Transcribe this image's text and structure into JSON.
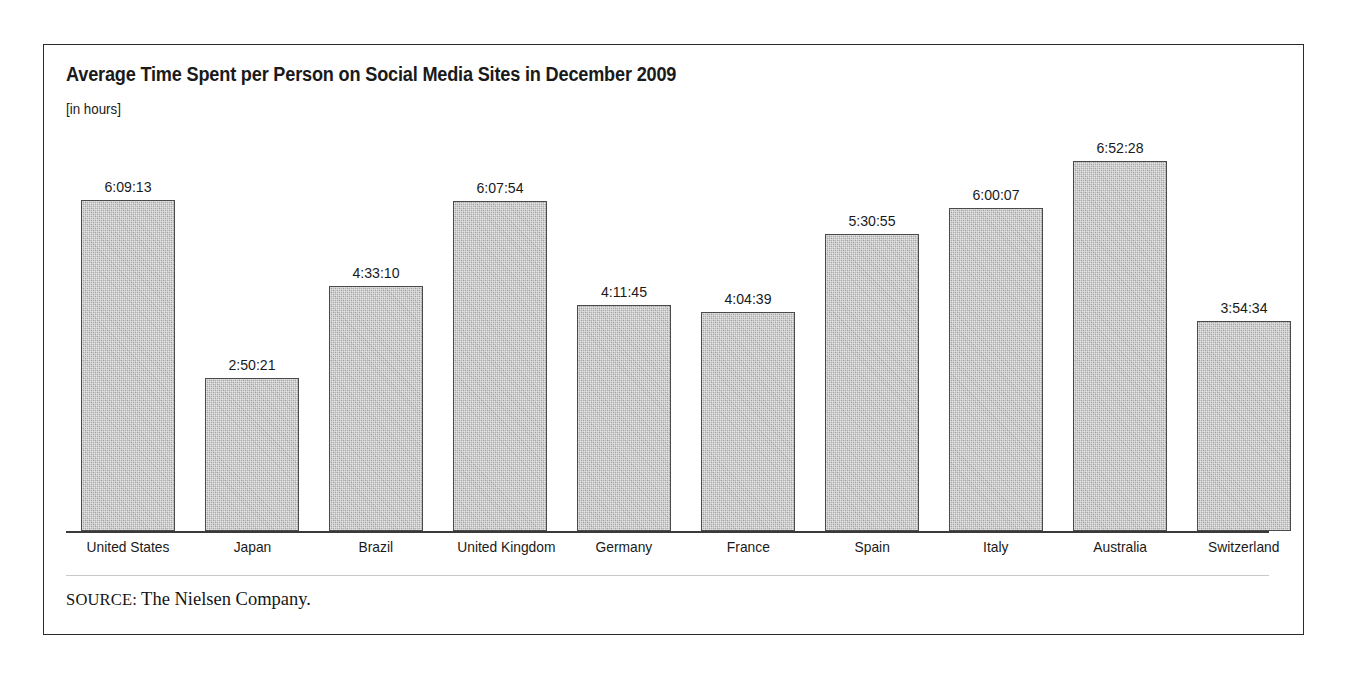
{
  "figure": {
    "title": "Average Time Spent per Person on Social Media Sites in December 2009",
    "subtitle": "[in hours]",
    "source_label": "SOURCE:",
    "source_text": "The Nielsen Company.",
    "frame_color": "#2b2b2b",
    "bar_fill_color": "#b0b0b0",
    "bar_border_color": "#4a4a4a",
    "axis_color": "#3a3a3a",
    "text_color": "#1a1a1a"
  },
  "chart_data": {
    "type": "bar",
    "title": "Average Time Spent per Person on Social Media Sites in December 2009",
    "subtitle": "[in hours]",
    "xlabel": "",
    "ylabel": "[in hours]",
    "grid": false,
    "legend": "none",
    "axis_visible": {
      "x": true,
      "y": false
    },
    "ylim": [
      0,
      7.25
    ],
    "value_format": "h:mm:ss",
    "categories": [
      "United States",
      "Japan",
      "Brazil",
      "United Kingdom",
      "Germany",
      "France",
      "Spain",
      "Italy",
      "Australia",
      "Switzerland"
    ],
    "value_labels": [
      "6:09:13",
      "2:50:21",
      "4:33:10",
      "6:07:54",
      "4:11:45",
      "4:04:39",
      "5:30:55",
      "6:00:07",
      "6:52:28",
      "3:54:34"
    ],
    "values": [
      6.1536,
      2.8392,
      4.5528,
      6.1317,
      4.1958,
      4.0775,
      5.5153,
      6.0019,
      6.8744,
      3.9094
    ],
    "bars": [
      {
        "category": "United States",
        "label": "6:09:13",
        "value": 6.1536
      },
      {
        "category": "Japan",
        "label": "2:50:21",
        "value": 2.8392
      },
      {
        "category": "Brazil",
        "label": "4:33:10",
        "value": 4.5528
      },
      {
        "category": "United Kingdom",
        "label": "6:07:54",
        "value": 6.1317
      },
      {
        "category": "Germany",
        "label": "4:11:45",
        "value": 4.1958
      },
      {
        "category": "France",
        "label": "4:04:39",
        "value": 4.0775
      },
      {
        "category": "Spain",
        "label": "5:30:55",
        "value": 5.5153
      },
      {
        "category": "Italy",
        "label": "6:00:07",
        "value": 6.0019
      },
      {
        "category": "Australia",
        "label": "6:52:28",
        "value": 6.8744
      },
      {
        "category": "Switzerland",
        "label": "3:54:34",
        "value": 3.9094
      }
    ]
  }
}
